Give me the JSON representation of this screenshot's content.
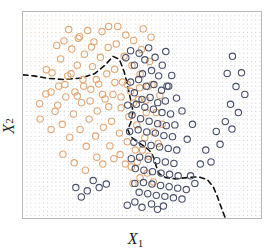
{
  "figure": {
    "title": "",
    "xlabel_main": "X",
    "xlabel_sub": "1",
    "ylabel_main": "X",
    "ylabel_sub": "2",
    "frame_color": "#b9b9b9",
    "background": "#ffffff"
  },
  "chart_data": {
    "type": "scatter",
    "title": "",
    "xlabel": "X1",
    "ylabel": "X2",
    "xlim": [
      0,
      1
    ],
    "ylim": [
      0,
      1
    ],
    "grid": false,
    "legend": "none",
    "mesh": {
      "visible": true,
      "spacing_px": 4.2,
      "dot_radius_px": 0.55,
      "color_class_light": "#e8cdb4",
      "color_class_dark": "#c9cede"
    },
    "boundary": {
      "style": "dashed",
      "color": "#111111",
      "width_px": 1.6,
      "dash": "5,4",
      "path_points_norm": [
        [
          0.0,
          0.695
        ],
        [
          0.045,
          0.69
        ],
        [
          0.105,
          0.678
        ],
        [
          0.175,
          0.672
        ],
        [
          0.245,
          0.68
        ],
        [
          0.3,
          0.7
        ],
        [
          0.345,
          0.742
        ],
        [
          0.378,
          0.785
        ],
        [
          0.405,
          0.77
        ],
        [
          0.425,
          0.71
        ],
        [
          0.44,
          0.64
        ],
        [
          0.452,
          0.575
        ],
        [
          0.462,
          0.52
        ],
        [
          0.455,
          0.47
        ],
        [
          0.44,
          0.43
        ],
        [
          0.452,
          0.395
        ],
        [
          0.48,
          0.37
        ],
        [
          0.51,
          0.348
        ],
        [
          0.538,
          0.32
        ],
        [
          0.552,
          0.285
        ],
        [
          0.56,
          0.25
        ],
        [
          0.572,
          0.215
        ],
        [
          0.6,
          0.196
        ],
        [
          0.64,
          0.19
        ],
        [
          0.69,
          0.196
        ],
        [
          0.735,
          0.2
        ],
        [
          0.775,
          0.186
        ],
        [
          0.8,
          0.15
        ],
        [
          0.818,
          0.1
        ],
        [
          0.835,
          0.045
        ],
        [
          0.85,
          0.0
        ]
      ]
    },
    "series": [
      {
        "name": "class-light",
        "marker": "open-circle",
        "color": "#e0a878",
        "radius_px": 3.2,
        "count": 108,
        "points": [
          [
            0.07,
            0.555
          ],
          [
            0.096,
            0.602
          ],
          [
            0.122,
            0.705
          ],
          [
            0.135,
            0.518
          ],
          [
            0.15,
            0.64
          ],
          [
            0.158,
            0.772
          ],
          [
            0.165,
            0.455
          ],
          [
            0.172,
            0.86
          ],
          [
            0.18,
            0.588
          ],
          [
            0.188,
            0.69
          ],
          [
            0.196,
            0.392
          ],
          [
            0.205,
            0.82
          ],
          [
            0.212,
            0.505
          ],
          [
            0.218,
            0.612
          ],
          [
            0.228,
            0.742
          ],
          [
            0.232,
            0.872
          ],
          [
            0.24,
            0.43
          ],
          [
            0.246,
            0.56
          ],
          [
            0.252,
            0.672
          ],
          [
            0.258,
            0.795
          ],
          [
            0.266,
            0.348
          ],
          [
            0.272,
            0.91
          ],
          [
            0.278,
            0.48
          ],
          [
            0.285,
            0.625
          ],
          [
            0.292,
            0.735
          ],
          [
            0.298,
            0.855
          ],
          [
            0.305,
            0.398
          ],
          [
            0.312,
            0.52
          ],
          [
            0.318,
            0.65
          ],
          [
            0.325,
            0.78
          ],
          [
            0.332,
            0.905
          ],
          [
            0.338,
            0.44
          ],
          [
            0.345,
            0.578
          ],
          [
            0.352,
            0.7
          ],
          [
            0.358,
            0.828
          ],
          [
            0.365,
            0.35
          ],
          [
            0.372,
            0.47
          ],
          [
            0.378,
            0.6
          ],
          [
            0.385,
            0.722
          ],
          [
            0.392,
            0.845
          ],
          [
            0.398,
            0.93
          ],
          [
            0.405,
            0.412
          ],
          [
            0.412,
            0.535
          ],
          [
            0.418,
            0.66
          ],
          [
            0.425,
            0.785
          ],
          [
            0.432,
            0.888
          ],
          [
            0.438,
            0.37
          ],
          [
            0.445,
            0.492
          ],
          [
            0.452,
            0.615
          ],
          [
            0.458,
            0.74
          ],
          [
            0.465,
            0.862
          ],
          [
            0.472,
            0.33
          ],
          [
            0.478,
            0.452
          ],
          [
            0.485,
            0.575
          ],
          [
            0.492,
            0.698
          ],
          [
            0.498,
            0.818
          ],
          [
            0.505,
            0.918
          ],
          [
            0.512,
            0.39
          ],
          [
            0.518,
            0.512
          ],
          [
            0.525,
            0.638
          ],
          [
            0.532,
            0.76
          ],
          [
            0.538,
            0.878
          ],
          [
            0.072,
            0.48
          ],
          [
            0.098,
            0.72
          ],
          [
            0.118,
            0.43
          ],
          [
            0.142,
            0.838
          ],
          [
            0.168,
            0.31
          ],
          [
            0.192,
            0.915
          ],
          [
            0.215,
            0.268
          ],
          [
            0.238,
            0.88
          ],
          [
            0.262,
            0.232
          ],
          [
            0.288,
            0.83
          ],
          [
            0.31,
            0.295
          ],
          [
            0.335,
            0.262
          ],
          [
            0.36,
            0.93
          ],
          [
            0.382,
            0.288
          ],
          [
            0.408,
            0.308
          ],
          [
            0.43,
            0.262
          ],
          [
            0.455,
            0.248
          ],
          [
            0.48,
            0.272
          ],
          [
            0.502,
            0.33
          ],
          [
            0.528,
            0.3
          ],
          [
            0.118,
            0.612
          ],
          [
            0.146,
            0.548
          ],
          [
            0.176,
            0.648
          ],
          [
            0.202,
            0.7
          ],
          [
            0.228,
            0.592
          ],
          [
            0.255,
            0.64
          ],
          [
            0.282,
            0.568
          ],
          [
            0.308,
            0.672
          ],
          [
            0.334,
            0.6
          ],
          [
            0.36,
            0.54
          ],
          [
            0.386,
            0.658
          ],
          [
            0.412,
            0.588
          ],
          [
            0.438,
            0.648
          ],
          [
            0.464,
            0.558
          ],
          [
            0.49,
            0.632
          ],
          [
            0.516,
            0.572
          ],
          [
            0.542,
            0.648
          ],
          [
            0.56,
            0.512
          ],
          [
            0.575,
            0.595
          ],
          [
            0.548,
            0.418
          ],
          [
            0.568,
            0.362
          ],
          [
            0.585,
            0.455
          ],
          [
            0.522,
            0.218
          ],
          [
            0.548,
            0.175
          ],
          [
            0.492,
            0.195
          ],
          [
            0.462,
            0.168
          ]
        ]
      },
      {
        "name": "class-dark",
        "marker": "open-circle",
        "color": "#4a5068",
        "radius_px": 3.2,
        "count": 106,
        "points": [
          [
            0.432,
            0.778
          ],
          [
            0.452,
            0.812
          ],
          [
            0.468,
            0.742
          ],
          [
            0.488,
            0.8
          ],
          [
            0.502,
            0.7
          ],
          [
            0.512,
            0.768
          ],
          [
            0.528,
            0.826
          ],
          [
            0.54,
            0.716
          ],
          [
            0.555,
            0.78
          ],
          [
            0.57,
            0.69
          ],
          [
            0.585,
            0.742
          ],
          [
            0.6,
            0.808
          ],
          [
            0.452,
            0.66
          ],
          [
            0.468,
            0.608
          ],
          [
            0.486,
            0.672
          ],
          [
            0.5,
            0.576
          ],
          [
            0.518,
            0.64
          ],
          [
            0.534,
            0.585
          ],
          [
            0.55,
            0.648
          ],
          [
            0.566,
            0.56
          ],
          [
            0.582,
            0.62
          ],
          [
            0.598,
            0.568
          ],
          [
            0.612,
            0.64
          ],
          [
            0.44,
            0.548
          ],
          [
            0.458,
            0.5
          ],
          [
            0.476,
            0.552
          ],
          [
            0.494,
            0.482
          ],
          [
            0.512,
            0.538
          ],
          [
            0.53,
            0.47
          ],
          [
            0.548,
            0.528
          ],
          [
            0.566,
            0.458
          ],
          [
            0.584,
            0.512
          ],
          [
            0.602,
            0.448
          ],
          [
            0.62,
            0.505
          ],
          [
            0.638,
            0.452
          ],
          [
            0.448,
            0.42
          ],
          [
            0.466,
            0.368
          ],
          [
            0.484,
            0.428
          ],
          [
            0.502,
            0.36
          ],
          [
            0.52,
            0.418
          ],
          [
            0.538,
            0.352
          ],
          [
            0.556,
            0.412
          ],
          [
            0.574,
            0.345
          ],
          [
            0.592,
            0.4
          ],
          [
            0.61,
            0.338
          ],
          [
            0.628,
            0.395
          ],
          [
            0.646,
            0.33
          ],
          [
            0.455,
            0.288
          ],
          [
            0.472,
            0.24
          ],
          [
            0.49,
            0.295
          ],
          [
            0.508,
            0.232
          ],
          [
            0.526,
            0.285
          ],
          [
            0.544,
            0.225
          ],
          [
            0.562,
            0.278
          ],
          [
            0.58,
            0.218
          ],
          [
            0.598,
            0.272
          ],
          [
            0.616,
            0.212
          ],
          [
            0.634,
            0.265
          ],
          [
            0.652,
            0.205
          ],
          [
            0.47,
            0.168
          ],
          [
            0.488,
            0.125
          ],
          [
            0.506,
            0.172
          ],
          [
            0.524,
            0.118
          ],
          [
            0.542,
            0.165
          ],
          [
            0.56,
            0.11
          ],
          [
            0.578,
            0.158
          ],
          [
            0.596,
            0.105
          ],
          [
            0.614,
            0.152
          ],
          [
            0.632,
            0.098
          ],
          [
            0.65,
            0.145
          ],
          [
            0.668,
            0.092
          ],
          [
            0.686,
            0.138
          ],
          [
            0.704,
            0.205
          ],
          [
            0.722,
            0.168
          ],
          [
            0.745,
            0.262
          ],
          [
            0.768,
            0.33
          ],
          [
            0.79,
            0.272
          ],
          [
            0.812,
            0.42
          ],
          [
            0.828,
            0.358
          ],
          [
            0.85,
            0.468
          ],
          [
            0.872,
            0.552
          ],
          [
            0.895,
            0.638
          ],
          [
            0.918,
            0.705
          ],
          [
            0.932,
            0.6
          ],
          [
            0.905,
            0.512
          ],
          [
            0.878,
            0.432
          ],
          [
            0.858,
            0.702
          ],
          [
            0.88,
            0.785
          ],
          [
            0.712,
            0.455
          ],
          [
            0.69,
            0.382
          ],
          [
            0.668,
            0.52
          ],
          [
            0.645,
            0.582
          ],
          [
            0.625,
            0.692
          ],
          [
            0.605,
            0.64
          ],
          [
            0.59,
            0.058
          ],
          [
            0.565,
            0.042
          ],
          [
            0.54,
            0.068
          ],
          [
            0.5,
            0.052
          ],
          [
            0.47,
            0.078
          ],
          [
            0.438,
            0.062
          ],
          [
            0.35,
            0.165
          ],
          [
            0.32,
            0.148
          ],
          [
            0.295,
            0.182
          ],
          [
            0.27,
            0.132
          ],
          [
            0.245,
            0.102
          ],
          [
            0.222,
            0.148
          ]
        ]
      }
    ]
  }
}
